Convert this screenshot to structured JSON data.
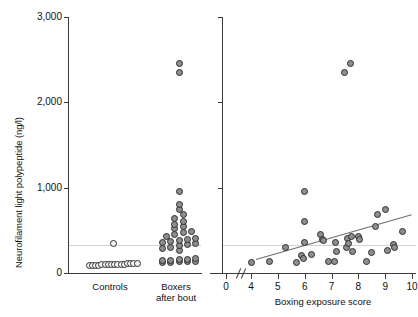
{
  "figure": {
    "y_axis_title": "Neurofilament light polypeptide (ng/l)",
    "y_ticks": [
      "3,000",
      "2,000",
      "1,000",
      "0"
    ],
    "y_tick_values": [
      3000,
      2000,
      1000,
      0
    ],
    "y_limits": [
      0,
      3000
    ]
  },
  "left_panel": {
    "category_labels": [
      {
        "line1": "Controls",
        "line2": ""
      },
      {
        "line1": "Boxers",
        "line2": "after bout"
      }
    ]
  },
  "right_panel": {
    "x_axis_title": "Boxing exposure score",
    "x_ticks": [
      "0",
      "4",
      "5",
      "6",
      "7",
      "8",
      "9",
      "10"
    ],
    "x_tick_values": [
      0,
      4,
      5,
      6,
      7,
      8,
      9,
      10
    ],
    "axis_break": true
  },
  "chart_data": [
    {
      "type": "scatter",
      "panel": "left",
      "title": "",
      "xlabel": "",
      "ylabel": "Neurofilament light polypeptide (ng/l)",
      "ylim": [
        0,
        3000
      ],
      "grid": false,
      "legend": "none",
      "categories": [
        "Controls",
        "Boxers after bout"
      ],
      "reference_line": {
        "y": 330,
        "style": "light-gray-horizontal"
      },
      "series": [
        {
          "name": "Controls",
          "marker": "open-circle",
          "values": [
            85,
            88,
            90,
            92,
            95,
            95,
            98,
            100,
            100,
            102,
            105,
            105,
            108,
            110,
            112,
            115,
            350
          ]
        },
        {
          "name": "Boxers after bout",
          "marker": "filled-circle",
          "values": [
            120,
            125,
            130,
            135,
            140,
            145,
            150,
            155,
            160,
            165,
            260,
            290,
            300,
            320,
            330,
            340,
            355,
            365,
            380,
            395,
            410,
            430,
            450,
            470,
            490,
            520,
            545,
            570,
            600,
            640,
            690,
            745,
            800,
            950,
            2350,
            2450
          ]
        }
      ]
    },
    {
      "type": "scatter",
      "panel": "right",
      "title": "",
      "xlabel": "Boxing exposure score",
      "ylabel": "Neurofilament light polypeptide (ng/l)",
      "xlim": [
        4,
        10
      ],
      "ylim": [
        0,
        3000
      ],
      "grid": false,
      "legend": "none",
      "axis_break_between": [
        0,
        4
      ],
      "reference_line": {
        "y": 330,
        "style": "light-gray-horizontal"
      },
      "regression_line": {
        "x_start": 4.2,
        "y_start": 165,
        "x_end": 10.0,
        "y_end": 690
      },
      "points": [
        {
          "x": 4.0,
          "y": 120
        },
        {
          "x": 4.7,
          "y": 130
        },
        {
          "x": 5.3,
          "y": 300
        },
        {
          "x": 5.7,
          "y": 125
        },
        {
          "x": 5.9,
          "y": 200
        },
        {
          "x": 5.95,
          "y": 175
        },
        {
          "x": 6.0,
          "y": 950
        },
        {
          "x": 6.0,
          "y": 600
        },
        {
          "x": 6.0,
          "y": 355
        },
        {
          "x": 6.25,
          "y": 215
        },
        {
          "x": 6.6,
          "y": 450
        },
        {
          "x": 6.65,
          "y": 395
        },
        {
          "x": 6.7,
          "y": 380
        },
        {
          "x": 6.9,
          "y": 130
        },
        {
          "x": 7.1,
          "y": 130
        },
        {
          "x": 7.15,
          "y": 355
        },
        {
          "x": 7.2,
          "y": 250
        },
        {
          "x": 7.5,
          "y": 2350
        },
        {
          "x": 7.55,
          "y": 300
        },
        {
          "x": 7.6,
          "y": 410
        },
        {
          "x": 7.65,
          "y": 340
        },
        {
          "x": 7.7,
          "y": 2450
        },
        {
          "x": 7.75,
          "y": 430
        },
        {
          "x": 7.8,
          "y": 250
        },
        {
          "x": 8.0,
          "y": 430
        },
        {
          "x": 8.05,
          "y": 390
        },
        {
          "x": 8.3,
          "y": 130
        },
        {
          "x": 8.5,
          "y": 240
        },
        {
          "x": 8.65,
          "y": 545
        },
        {
          "x": 8.7,
          "y": 690
        },
        {
          "x": 9.0,
          "y": 745
        },
        {
          "x": 9.1,
          "y": 260
        },
        {
          "x": 9.3,
          "y": 330
        },
        {
          "x": 9.35,
          "y": 300
        },
        {
          "x": 9.65,
          "y": 490
        }
      ]
    }
  ]
}
